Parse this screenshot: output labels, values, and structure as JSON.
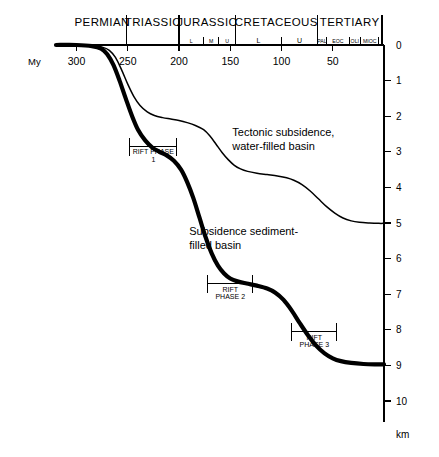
{
  "chart_data": {
    "type": "line",
    "title": "",
    "xlabel": "My",
    "ylabel": "km",
    "xlim": [
      320,
      0
    ],
    "ylim": [
      0,
      10.6
    ],
    "x_axis_position": "top",
    "y_axis_position": "right",
    "grid": false,
    "legend": false,
    "x_ticks": [
      300,
      250,
      200,
      150,
      100,
      50
    ],
    "x_tick_labels": [
      "300",
      "250",
      "200",
      "150",
      "100",
      "50"
    ],
    "y_ticks": [
      0,
      1,
      2,
      3,
      4,
      5,
      6,
      7,
      8,
      9,
      10
    ],
    "y_tick_labels": [
      "0",
      "1",
      "2",
      "3",
      "4",
      "5",
      "6",
      "7",
      "8",
      "9",
      "10"
    ],
    "periods": [
      {
        "name": "PERMIAN",
        "start": 299,
        "end": 251
      },
      {
        "name": "TRIASSIC",
        "start": 251,
        "end": 200
      },
      {
        "name": "JURASSIC",
        "start": 200,
        "end": 145
      },
      {
        "name": "CRETACEOUS",
        "start": 145,
        "end": 65
      },
      {
        "name": "TERTIARY",
        "start": 65,
        "end": 2
      }
    ],
    "epochs": [
      {
        "name": "L",
        "period": "JURASSIC",
        "start": 200,
        "end": 176
      },
      {
        "name": "M",
        "period": "JURASSIC",
        "start": 176,
        "end": 161
      },
      {
        "name": "U",
        "period": "JURASSIC",
        "start": 161,
        "end": 145
      },
      {
        "name": "L",
        "period": "CRETACEOUS",
        "start": 145,
        "end": 100
      },
      {
        "name": "U",
        "period": "CRETACEOUS",
        "start": 100,
        "end": 65
      },
      {
        "name": "PAL",
        "period": "TERTIARY",
        "start": 65,
        "end": 56
      },
      {
        "name": "EOC",
        "period": "TERTIARY",
        "start": 56,
        "end": 34
      },
      {
        "name": "OLI",
        "period": "TERTIARY",
        "start": 34,
        "end": 23
      },
      {
        "name": "MIOC",
        "period": "TERTIARY",
        "start": 23,
        "end": 5
      }
    ],
    "series": [
      {
        "name": "Tectonic subsidence, water-filled basin",
        "style": "thin",
        "points": [
          [
            320,
            0.0
          ],
          [
            300,
            0.0
          ],
          [
            285,
            0.02
          ],
          [
            275,
            0.06
          ],
          [
            268,
            0.15
          ],
          [
            262,
            0.35
          ],
          [
            256,
            0.7
          ],
          [
            250,
            1.1
          ],
          [
            244,
            1.45
          ],
          [
            238,
            1.7
          ],
          [
            231,
            1.88
          ],
          [
            224,
            1.98
          ],
          [
            216,
            2.04
          ],
          [
            208,
            2.08
          ],
          [
            200,
            2.12
          ],
          [
            192,
            2.18
          ],
          [
            184,
            2.26
          ],
          [
            176,
            2.38
          ],
          [
            170,
            2.55
          ],
          [
            164,
            2.78
          ],
          [
            158,
            3.02
          ],
          [
            152,
            3.22
          ],
          [
            146,
            3.38
          ],
          [
            140,
            3.48
          ],
          [
            133,
            3.55
          ],
          [
            124,
            3.6
          ],
          [
            114,
            3.64
          ],
          [
            104,
            3.68
          ],
          [
            95,
            3.73
          ],
          [
            88,
            3.8
          ],
          [
            80,
            3.92
          ],
          [
            72,
            4.1
          ],
          [
            64,
            4.32
          ],
          [
            56,
            4.54
          ],
          [
            48,
            4.72
          ],
          [
            40,
            4.86
          ],
          [
            32,
            4.94
          ],
          [
            24,
            4.98
          ],
          [
            14,
            5.0
          ],
          [
            5,
            5.01
          ],
          [
            0,
            5.01
          ]
        ]
      },
      {
        "name": "Subsidence sediment-filled basin",
        "style": "thick",
        "points": [
          [
            320,
            0.0
          ],
          [
            300,
            0.0
          ],
          [
            285,
            0.03
          ],
          [
            276,
            0.1
          ],
          [
            270,
            0.26
          ],
          [
            264,
            0.56
          ],
          [
            258,
            1.0
          ],
          [
            252,
            1.5
          ],
          [
            246,
            1.98
          ],
          [
            240,
            2.38
          ],
          [
            233,
            2.68
          ],
          [
            226,
            2.88
          ],
          [
            219,
            3.0
          ],
          [
            212,
            3.1
          ],
          [
            205,
            3.25
          ],
          [
            198,
            3.5
          ],
          [
            192,
            3.85
          ],
          [
            186,
            4.3
          ],
          [
            180,
            4.85
          ],
          [
            174,
            5.4
          ],
          [
            168,
            5.86
          ],
          [
            162,
            6.2
          ],
          [
            156,
            6.42
          ],
          [
            150,
            6.56
          ],
          [
            143,
            6.64
          ],
          [
            134,
            6.7
          ],
          [
            124,
            6.76
          ],
          [
            114,
            6.84
          ],
          [
            106,
            6.96
          ],
          [
            98,
            7.16
          ],
          [
            90,
            7.46
          ],
          [
            82,
            7.82
          ],
          [
            74,
            8.16
          ],
          [
            66,
            8.45
          ],
          [
            58,
            8.66
          ],
          [
            50,
            8.8
          ],
          [
            42,
            8.88
          ],
          [
            32,
            8.93
          ],
          [
            20,
            8.96
          ],
          [
            8,
            8.97
          ],
          [
            0,
            8.97
          ]
        ]
      }
    ],
    "annotations": [
      {
        "id": "tectonic",
        "lines": [
          "Tectonic subsidence,",
          "water-filled basin"
        ],
        "x": 148,
        "y": 2.55
      },
      {
        "id": "sediment",
        "lines": [
          "Subsidence sediment-",
          "filled basin"
        ],
        "x": 190,
        "y": 5.35
      }
    ],
    "rift_phases": [
      {
        "id": "rift-phase-1",
        "lines": [
          "RIFT PHASE",
          "1"
        ],
        "start": 248,
        "end": 202,
        "y": 2.85
      },
      {
        "id": "rift-phase-2",
        "lines": [
          "RIFT",
          "PHASE 2"
        ],
        "start": 172,
        "end": 128,
        "y": 6.7
      },
      {
        "id": "rift-phase-3",
        "lines": [
          "RIFT",
          "PHASE 3"
        ],
        "start": 90,
        "end": 46,
        "y": 8.05
      }
    ]
  },
  "axes": {
    "time_label": "My",
    "depth_label": "km"
  },
  "colors": {
    "ink": "#000000",
    "background": "#ffffff"
  }
}
